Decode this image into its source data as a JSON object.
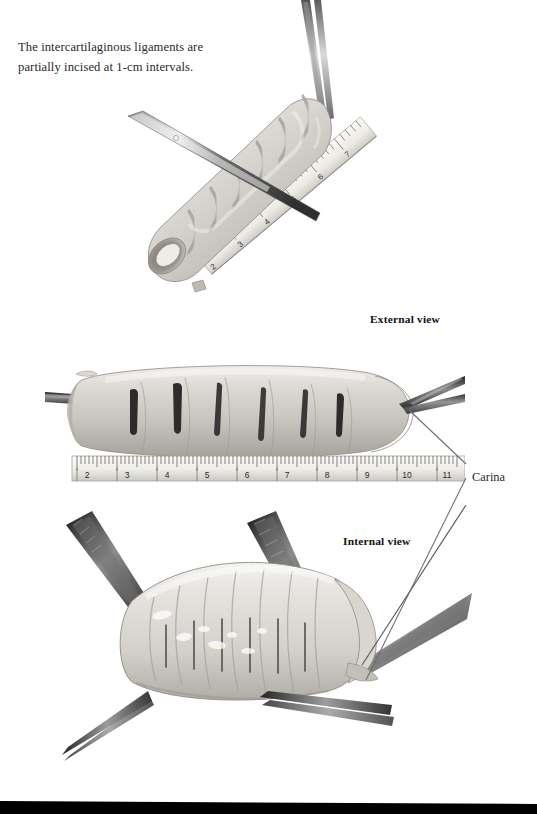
{
  "figure": {
    "caption": "The intercartilaginous ligaments are partially incised at 1-cm intervals.",
    "caption_line_1": "The intercartilaginous ligaments are",
    "caption_line_2": "partially incised at 1-cm intervals.",
    "background_color": "#ffffff",
    "text_color": "#2a2a2a"
  },
  "labels": {
    "external_view": "External view",
    "internal_view": "Internal view",
    "carina": "Carina"
  },
  "panels": [
    {
      "id": "top",
      "name": "external-oblique-view",
      "label": "External view",
      "description": "Resected tracheal segment held by forceps with a scalpel incising an intercartilaginous ligament, measured against a diagonal ruler.",
      "instruments": [
        "forceps",
        "scalpel",
        "ruler"
      ],
      "tracheal_rings_visible": 6
    },
    {
      "id": "middle",
      "name": "external-lateral-view",
      "label": "External view",
      "description": "Lateral external view of the trachea showing six partial incisions spaced at 1-cm intervals along the ruler.",
      "instruments": [
        "clamp",
        "forceps",
        "ruler"
      ],
      "incisions": 6
    },
    {
      "id": "bottom",
      "name": "internal-view",
      "label": "Internal view",
      "description": "Trachea opened longitudinally and retracted by four forceps, showing the intercartilaginous incisions from inside and the carina at the right.",
      "instruments": [
        "forceps"
      ],
      "forceps_count": 4
    }
  ],
  "rulers": {
    "middle": {
      "unit": "cm",
      "ticks": [
        2,
        3,
        4,
        5,
        6,
        7,
        8,
        9,
        10,
        11
      ]
    },
    "top": {
      "unit": "cm",
      "ticks": [
        2,
        3,
        4,
        5,
        6,
        7,
        8
      ]
    }
  },
  "colors": {
    "page_background": "#ffffff",
    "specimen_light": "#e8e6e2",
    "specimen_mid": "#c9c6c0",
    "specimen_shadow": "#9b9792",
    "incision_dark": "#2b2b2b",
    "metal_light": "#e3e3e3",
    "metal_dark": "#3a3a3a",
    "ruler_face": "#f2f1ed",
    "leader_line": "#6d6d6d",
    "bottom_bar": "#000000"
  }
}
